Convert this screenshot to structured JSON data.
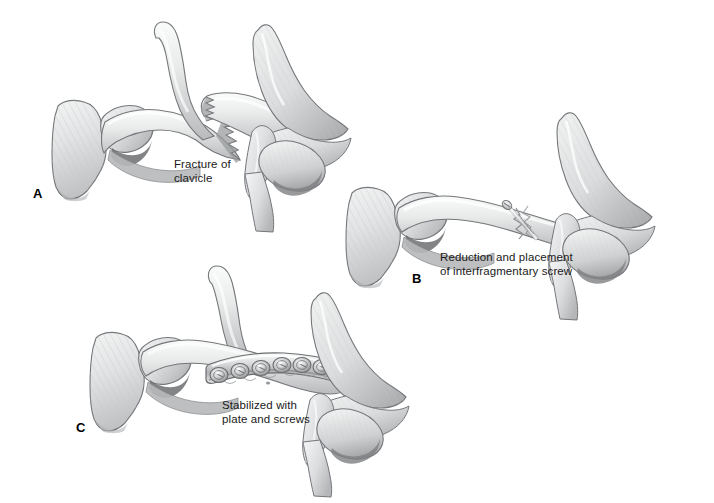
{
  "figure": {
    "background_color": "#ffffff",
    "bone_fill_light": "#eceded",
    "bone_fill_mid": "#d9dadb",
    "bone_fill_dark": "#b9bbbc",
    "bone_shadow": "#8e9092",
    "outline_color": "#6f7173",
    "metal_light": "#f2f3f3",
    "metal_mid": "#c9cbcc",
    "metal_dark": "#8a8c8e",
    "text_color": "#1a1a1a"
  },
  "panels": [
    {
      "letter": "A",
      "caption_line1": "Fracture of",
      "caption_line2": "clavicle",
      "caption": "Fracture of\nclavicle",
      "description": "Displaced midshaft clavicle fracture with jagged bone ends"
    },
    {
      "letter": "B",
      "caption_line1": "Reduction and placement",
      "caption_line2": "of interfragmentary screw",
      "caption": "Reduction and placement\nof interfragmentary screw",
      "description": "Fracture reduced and fixed with a single interfragmentary lag screw"
    },
    {
      "letter": "C",
      "caption_line1": "Stabilized with",
      "caption_line2": "plate and screws",
      "caption": "Stabilized with\nplate and screws",
      "description": "Fracture stabilized with a contoured compression plate and seven screws"
    }
  ],
  "anatomy": {
    "structures": [
      "sternum",
      "manubrium",
      "clavicle",
      "scapula",
      "acromion",
      "coracoid process",
      "humeral head",
      "first rib"
    ]
  },
  "hardware": {
    "plate_screw_count": 7,
    "interfragmentary_screw_count": 1
  }
}
